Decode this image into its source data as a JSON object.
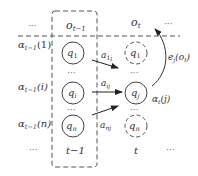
{
  "diagram": {
    "colors": {
      "stroke": "#444444",
      "text": "#333333",
      "background": "#ffffff"
    },
    "top_row": {
      "left_dots": "···",
      "obs_prev": "o",
      "obs_prev_sub": "t−1",
      "obs_curr": "o",
      "obs_curr_sub": "t",
      "right_dots": "···"
    },
    "alpha_labels": [
      {
        "base": "α",
        "sub": "t−1",
        "arg": "(1)"
      },
      {
        "base": "α",
        "sub": "t−1",
        "arg": "(i)"
      },
      {
        "base": "α",
        "sub": "t−1",
        "arg": "(n)"
      }
    ],
    "prev_states": [
      {
        "base": "q",
        "sub": "1"
      },
      {
        "base": "q",
        "sub": "i"
      },
      {
        "base": "q",
        "sub": "n"
      }
    ],
    "curr_states": [
      {
        "base": "q",
        "sub": "1",
        "style": "dashed"
      },
      {
        "base": "q",
        "sub": "j",
        "style": "solid"
      },
      {
        "base": "q",
        "sub": "n",
        "style": "dashed"
      }
    ],
    "transitions": [
      {
        "base": "a",
        "sub": "1j"
      },
      {
        "base": "a",
        "sub": "ij"
      },
      {
        "base": "a",
        "sub": "nj"
      }
    ],
    "emission": {
      "base": "e",
      "sub": "j",
      "arg": "(o",
      "arg_sub": "t",
      "arg_close": ")"
    },
    "alpha_t": {
      "base": "α",
      "sub": "t",
      "arg": "(j)"
    },
    "vertical_dots": "···",
    "bottom_row": {
      "left_dots": "···",
      "time_prev": "t−1",
      "time_curr": "t",
      "right_dots": "···"
    }
  }
}
